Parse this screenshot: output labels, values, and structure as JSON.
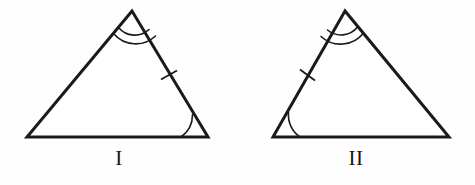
{
  "figure": {
    "width": 475,
    "height": 185,
    "background_color": "#fefefe",
    "stroke_color": "#1a1a1a"
  },
  "triangles": [
    {
      "id": "triangle-1",
      "label": "I",
      "orientation": "base-angle-at-bottom-right",
      "vertices": {
        "apex": {
          "x": 132,
          "y": 11
        },
        "bottom_left": {
          "x": 27,
          "y": 137
        },
        "bottom_right": {
          "x": 208,
          "y": 137
        }
      },
      "marks": {
        "apex_angle_arcs": 2,
        "base_angle_arcs": 1,
        "base_angle_vertex": "bottom_right",
        "side_ticks": 1,
        "ticked_side": "apex-to-bottom-right"
      }
    },
    {
      "id": "triangle-2",
      "label": "II",
      "orientation": "base-angle-at-bottom-left",
      "vertices": {
        "apex": {
          "x": 345,
          "y": 11
        },
        "bottom_left": {
          "x": 273,
          "y": 137
        },
        "bottom_right": {
          "x": 449,
          "y": 137
        }
      },
      "marks": {
        "apex_angle_arcs": 2,
        "base_angle_arcs": 1,
        "base_angle_vertex": "bottom_left",
        "side_ticks": 1,
        "ticked_side": "apex-to-bottom-left"
      }
    }
  ],
  "labels": {
    "triangle_1": "I",
    "triangle_2": "II"
  }
}
